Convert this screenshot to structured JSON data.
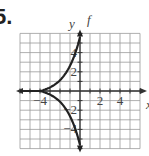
{
  "problem_number": "5.",
  "chart_data": {
    "type": "line",
    "title": "",
    "xlabel": "x",
    "ylabel": "y",
    "function_label": "f",
    "xlim": [
      -6,
      6
    ],
    "ylim": [
      -6,
      6
    ],
    "grid": true,
    "x_ticks": [
      -4,
      2,
      4
    ],
    "y_ticks": [
      4,
      2,
      -2,
      -4
    ],
    "x_tick_labels": [
      "−4",
      "2",
      "4"
    ],
    "y_tick_labels": [
      "4",
      "2",
      "−2",
      "−4"
    ],
    "series": [
      {
        "name": "f upper branch",
        "x": [
          -6,
          -4,
          -3,
          -2,
          -1,
          -0.5,
          0
        ],
        "y": [
          0,
          0,
          0.25,
          0.75,
          2,
          3.5,
          6
        ]
      },
      {
        "name": "f lower branch",
        "x": [
          -6,
          -4,
          -3,
          -2,
          -1,
          -0.5,
          0
        ],
        "y": [
          0,
          0,
          -0.25,
          -0.75,
          -2,
          -3.5,
          -6
        ]
      }
    ]
  }
}
